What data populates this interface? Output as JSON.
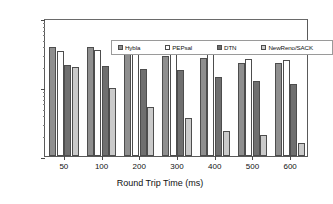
{
  "chart_data": {
    "type": "bar",
    "title": "",
    "xlabel": "Round Trip Time (ms)",
    "ylabel": "Goodput (kbit/s)",
    "categories": [
      "50",
      "100",
      "200",
      "300",
      "400",
      "500",
      "600"
    ],
    "yscale": "log",
    "ylim": [
      100,
      10000
    ],
    "yticks": [
      "100",
      "1000",
      "10000"
    ],
    "grid": false,
    "legend_position": "top-inside",
    "series": [
      {
        "name": "Hybla",
        "color": "#8f8f8f",
        "values": [
          3800,
          3850,
          3000,
          2800,
          2600,
          2200,
          2200
        ]
      },
      {
        "name": "PEPsal",
        "color": "#ffffff",
        "values": [
          3300,
          3450,
          3500,
          3200,
          3050,
          2550,
          2500
        ]
      },
      {
        "name": "DTN",
        "color": "#6f6f6f",
        "values": [
          2100,
          2050,
          1800,
          1780,
          1420,
          1220,
          1100
        ]
      },
      {
        "name": "NewReno/SACK",
        "color": "#cacaca",
        "values": [
          1950,
          980,
          520,
          360,
          230,
          205,
          155
        ]
      }
    ]
  },
  "axes": {
    "y_title": "Goodput (kbit/s)",
    "x_title": "Round Trip Time (ms)",
    "y_tick_top": "10000",
    "y_tick_mid": "1000",
    "y_tick_bottom": "100"
  },
  "legend": {
    "items": [
      {
        "label": "Hybla"
      },
      {
        "label": "PEPsal"
      },
      {
        "label": "DTN"
      },
      {
        "label": "NewReno/SACK"
      }
    ]
  }
}
